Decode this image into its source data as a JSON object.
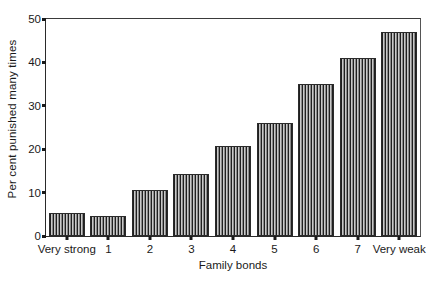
{
  "chart_data": {
    "type": "bar",
    "title": "",
    "xlabel": "Family bonds",
    "ylabel": "Per cent punished many times",
    "categories": [
      "Very strong",
      "1",
      "2",
      "3",
      "4",
      "5",
      "6",
      "7",
      "Very weak"
    ],
    "values": [
      5.3,
      4.5,
      10.5,
      14.2,
      20.8,
      26.0,
      35.0,
      41.0,
      47.0
    ],
    "ylim": [
      0,
      50
    ],
    "yticks": [
      0,
      10,
      20,
      30,
      40,
      50
    ],
    "ytick_labels": [
      "0",
      "10",
      "20",
      "30",
      "40",
      "50"
    ],
    "grid": false,
    "legend": false,
    "bar_fill": "vertical-hatch",
    "colors": {
      "axis": "#1a1a1a",
      "bar_line": "#2b2b2b",
      "bar_fill_dark": "#1f1f1f",
      "bar_fill_light": "#c9c9c9",
      "background": "#ffffff"
    }
  }
}
